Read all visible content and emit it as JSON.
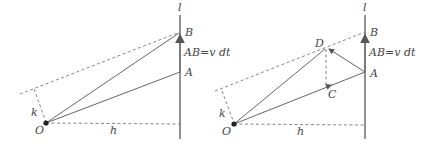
{
  "diagrams": [
    {
      "id": "left",
      "labels": {
        "line": "l",
        "B": "B",
        "AB": "AB=v dt",
        "A": "A",
        "k": "k",
        "O": "O",
        "h": "h"
      }
    },
    {
      "id": "right",
      "labels": {
        "line": "l",
        "B": "B",
        "AB": "AB=v dt",
        "A": "A",
        "D": "D",
        "C": "C",
        "k": "k",
        "O": "O",
        "h": "h"
      }
    }
  ],
  "colors": {
    "stroke": "#666666",
    "text": "#444444",
    "background": "#ffffff"
  }
}
